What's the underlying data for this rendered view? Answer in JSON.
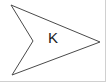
{
  "figure": {
    "type": "concave-polygon",
    "width": 106,
    "height": 82,
    "background_color": "#ffffff",
    "stroke_color": "#4a4a4a",
    "stroke_width": 1,
    "fill_color": "#ffffff",
    "vertices": [
      {
        "name": "top-left-point",
        "x": 11,
        "y": 5
      },
      {
        "name": "right-tip-point",
        "x": 100,
        "y": 42
      },
      {
        "name": "bottom-left-point",
        "x": 12,
        "y": 75
      },
      {
        "name": "inner-notch-point",
        "x": 33,
        "y": 41
      }
    ],
    "points_attr": "11,5 100,42 12,75 33,41",
    "label": {
      "text": "K",
      "x": 53,
      "y": 38,
      "font_size": 15,
      "color": "#1a1a1a"
    },
    "border": {
      "right_edge_color": "#d0d0d0",
      "bottom_edge_color": "#d0d0d0"
    }
  }
}
